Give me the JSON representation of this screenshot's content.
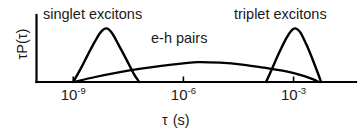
{
  "chart_data": {
    "type": "line",
    "title": "",
    "subtitle": "",
    "xlabel_symbol": "τ",
    "xlabel_unit": "(s)",
    "ylabel": "τP(τ)",
    "grid": false,
    "legend_position": "inline-annotations",
    "x_scale": "log",
    "xlim_decades": [
      -10.0,
      -1.3
    ],
    "ylim": [
      0,
      1
    ],
    "x_tick_labels": [
      "10⁻⁹",
      "10⁻⁶",
      "10⁻³"
    ],
    "x_tick_bases": [
      "10",
      "10",
      "10"
    ],
    "x_tick_exponents": [
      "-9",
      "-6",
      "-3"
    ],
    "x_tick_decades": [
      -9,
      -6,
      -3
    ],
    "y_tick_labels": [],
    "annotations": [
      {
        "text": "singlet excitons",
        "near_series": "singlet excitons"
      },
      {
        "text": "e-h pairs",
        "near_series": "e-h pairs"
      },
      {
        "text": "triplet excitons",
        "near_series": "triplet excitons"
      }
    ],
    "series": [
      {
        "name": "singlet excitons",
        "color": "#000000",
        "peak_x_decade": -8.1,
        "start_x_decade": -9.0,
        "end_x_decade": -7.2,
        "peak_y": 0.86,
        "points_decade_y": [
          [
            -9.0,
            0.0
          ],
          [
            -8.8,
            0.21
          ],
          [
            -8.6,
            0.44
          ],
          [
            -8.4,
            0.66
          ],
          [
            -8.25,
            0.8
          ],
          [
            -8.1,
            0.86
          ],
          [
            -7.95,
            0.79
          ],
          [
            -7.75,
            0.58
          ],
          [
            -7.55,
            0.36
          ],
          [
            -7.35,
            0.13
          ],
          [
            -7.2,
            0.0
          ]
        ]
      },
      {
        "name": "e-h pairs",
        "color": "#000000",
        "peak_x_decade": -5.6,
        "start_x_decade": -9.0,
        "end_x_decade": -2.3,
        "peak_y": 0.32,
        "points_decade_y": [
          [
            -9.0,
            0.0
          ],
          [
            -8.4,
            0.08
          ],
          [
            -7.8,
            0.15
          ],
          [
            -7.2,
            0.21
          ],
          [
            -6.6,
            0.26
          ],
          [
            -6.0,
            0.3
          ],
          [
            -5.6,
            0.32
          ],
          [
            -5.0,
            0.31
          ],
          [
            -4.4,
            0.28
          ],
          [
            -3.8,
            0.23
          ],
          [
            -3.2,
            0.17
          ],
          [
            -2.8,
            0.11
          ],
          [
            -2.5,
            0.05
          ],
          [
            -2.3,
            0.0
          ]
        ]
      },
      {
        "name": "triplet excitons",
        "color": "#000000",
        "peak_x_decade": -2.95,
        "start_x_decade": -3.75,
        "end_x_decade": -2.25,
        "peak_y": 0.86,
        "points_decade_y": [
          [
            -3.75,
            0.0
          ],
          [
            -3.58,
            0.22
          ],
          [
            -3.4,
            0.46
          ],
          [
            -3.2,
            0.7
          ],
          [
            -3.05,
            0.83
          ],
          [
            -2.95,
            0.86
          ],
          [
            -2.82,
            0.8
          ],
          [
            -2.65,
            0.6
          ],
          [
            -2.5,
            0.39
          ],
          [
            -2.35,
            0.16
          ],
          [
            -2.25,
            0.0
          ]
        ]
      }
    ]
  },
  "axes": {
    "y_axis_name": "y-axis",
    "x_axis_name": "x-axis"
  }
}
